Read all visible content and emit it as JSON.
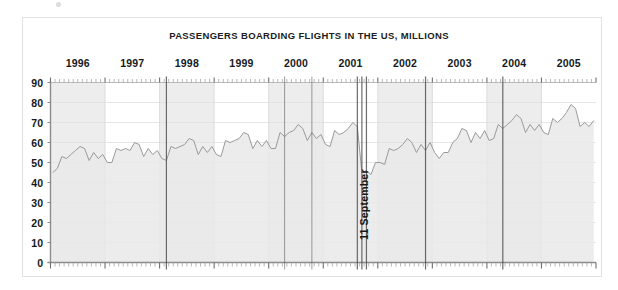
{
  "figure": {
    "title": "PASSENGERS BOARDING FLIGHTS IN THE US, MILLIONS",
    "annotation": "11 September"
  },
  "colors": {
    "title_text": "#1d1d1d",
    "axis_text": "#15191c",
    "line": "#9a9a9a",
    "area_fill": "#e9e9e9",
    "band_fill": "#ededed",
    "gridline": "#e0e0e0",
    "axis": "#8c8c8c",
    "marker_line": "#4a4a4a",
    "frame": "#e2e2e2",
    "background": "#ffffff"
  },
  "chart_data": {
    "type": "area",
    "title": "PASSENGERS BOARDING FLIGHTS IN THE US, MILLIONS",
    "xlabel": "",
    "ylabel": "",
    "ylim": [
      0,
      90
    ],
    "ytick_labels": [
      "0",
      "10",
      "20",
      "30",
      "40",
      "50",
      "60",
      "70",
      "80",
      "90"
    ],
    "yticks": [
      0,
      10,
      20,
      30,
      40,
      50,
      60,
      70,
      80,
      90
    ],
    "grid": true,
    "legend": "none",
    "xlim": [
      "1996-01",
      "2005-12"
    ],
    "xtick_labels": [
      "1996",
      "1997",
      "1998",
      "1999",
      "2000",
      "2001",
      "2002",
      "2003",
      "2004",
      "2005"
    ],
    "xticks": [
      1996,
      1997,
      1998,
      1999,
      2000,
      2001,
      2002,
      2003,
      2004,
      2005
    ],
    "minor_ticks": "monthly",
    "shaded_year_bands": [
      "1996",
      "1998",
      "2000",
      "2002",
      "2004"
    ],
    "annotations": [
      {
        "text": "11 September",
        "x": "2001-09",
        "orientation": "vertical"
      }
    ],
    "series": [
      {
        "name": "Passengers boarding flights in the US",
        "units": "millions",
        "x": [
          "1996-01",
          "1996-02",
          "1996-03",
          "1996-04",
          "1996-05",
          "1996-06",
          "1996-07",
          "1996-08",
          "1996-09",
          "1996-10",
          "1996-11",
          "1996-12",
          "1997-01",
          "1997-02",
          "1997-03",
          "1997-04",
          "1997-05",
          "1997-06",
          "1997-07",
          "1997-08",
          "1997-09",
          "1997-10",
          "1997-11",
          "1997-12",
          "1998-01",
          "1998-02",
          "1998-03",
          "1998-04",
          "1998-05",
          "1998-06",
          "1998-07",
          "1998-08",
          "1998-09",
          "1998-10",
          "1998-11",
          "1998-12",
          "1999-01",
          "1999-02",
          "1999-03",
          "1999-04",
          "1999-05",
          "1999-06",
          "1999-07",
          "1999-08",
          "1999-09",
          "1999-10",
          "1999-11",
          "1999-12",
          "2000-01",
          "2000-02",
          "2000-03",
          "2000-04",
          "2000-05",
          "2000-06",
          "2000-07",
          "2000-08",
          "2000-09",
          "2000-10",
          "2000-11",
          "2000-12",
          "2001-01",
          "2001-02",
          "2001-03",
          "2001-04",
          "2001-05",
          "2001-06",
          "2001-07",
          "2001-08",
          "2001-09",
          "2001-10",
          "2001-11",
          "2001-12",
          "2002-01",
          "2002-02",
          "2002-03",
          "2002-04",
          "2002-05",
          "2002-06",
          "2002-07",
          "2002-08",
          "2002-09",
          "2002-10",
          "2002-11",
          "2002-12",
          "2003-01",
          "2003-02",
          "2003-03",
          "2003-04",
          "2003-05",
          "2003-06",
          "2003-07",
          "2003-08",
          "2003-09",
          "2003-10",
          "2003-11",
          "2003-12",
          "2004-01",
          "2004-02",
          "2004-03",
          "2004-04",
          "2004-05",
          "2004-06",
          "2004-07",
          "2004-08",
          "2004-09",
          "2004-10",
          "2004-11",
          "2004-12",
          "2005-01",
          "2005-02",
          "2005-03",
          "2005-04",
          "2005-05",
          "2005-06",
          "2005-07",
          "2005-08",
          "2005-09",
          "2005-10",
          "2005-11",
          "2005-12"
        ],
        "values": [
          45,
          47,
          53,
          52,
          54,
          56,
          58,
          57,
          51,
          55,
          52,
          54,
          50,
          50,
          57,
          56,
          57,
          56,
          60,
          59,
          53,
          57,
          54,
          56,
          52,
          51,
          58,
          57,
          58,
          59,
          62,
          61,
          54,
          58,
          55,
          58,
          54,
          53,
          61,
          60,
          61,
          62,
          65,
          64,
          57,
          61,
          58,
          61,
          57,
          57,
          65,
          63,
          65,
          66,
          69,
          67,
          61,
          65,
          62,
          64,
          59,
          58,
          66,
          64,
          65,
          67,
          70,
          68,
          45,
          46,
          44,
          50,
          50,
          49,
          57,
          56,
          57,
          59,
          62,
          60,
          55,
          59,
          56,
          60,
          55,
          52,
          55,
          55,
          60,
          62,
          67,
          66,
          60,
          65,
          62,
          66,
          61,
          62,
          69,
          67,
          69,
          71,
          74,
          72,
          65,
          69,
          66,
          69,
          65,
          64,
          72,
          70,
          72,
          75,
          79,
          77,
          68,
          70,
          68,
          71
        ]
      }
    ]
  },
  "scan_marks": {
    "vertical_lines": [
      {
        "x": "1998-02",
        "weight": "heavy"
      },
      {
        "x": "2000-04",
        "weight": "medium"
      },
      {
        "x": "2000-10",
        "weight": "medium"
      },
      {
        "x": "2001-08",
        "weight": "heavy"
      },
      {
        "x": "2001-09",
        "weight": "heavy"
      },
      {
        "x": "2001-10",
        "weight": "heavy"
      },
      {
        "x": "2002-11",
        "weight": "heavy"
      },
      {
        "x": "2004-04",
        "weight": "heavy"
      }
    ]
  }
}
